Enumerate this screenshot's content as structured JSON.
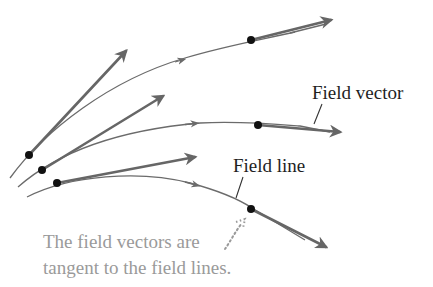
{
  "diagram": {
    "labels": {
      "field_vector": "Field vector",
      "field_line": "Field line",
      "caption_line1": "The field vectors are",
      "caption_line2": "tangent to the field lines."
    },
    "colors": {
      "field_line": "#6b6b6b",
      "field_vector": "#666666",
      "dot": "#111111",
      "label_text": "#1f1f1f",
      "caption_text": "#9a9a9a"
    },
    "field_lines": [
      {
        "name": "top",
        "points_on_line": 2
      },
      {
        "name": "middle",
        "points_on_line": 2
      },
      {
        "name": "bottom",
        "points_on_line": 2
      }
    ],
    "field_vector_count": 6,
    "dot_count": 6
  }
}
